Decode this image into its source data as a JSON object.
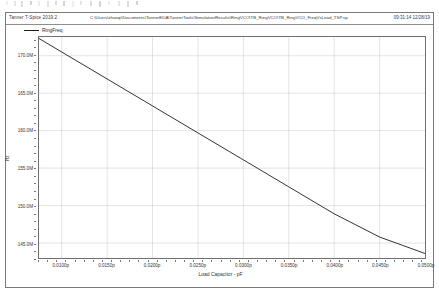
{
  "header": {
    "app_title": "Tanner T-Spice 2019.2",
    "file_path": "C:\\Users\\zhaoqi\\Documents\\TannerEDA\\TannerTools\\SimulationResults\\RingVCO\\TB_RingVCO\\TB_RingVCO_FreqVsLoad_TSP.sp",
    "timestamp": "09:31:14 12/28/19"
  },
  "legend": {
    "label": "RingFreq",
    "color": "#1b1b1b"
  },
  "chart_data": {
    "type": "line",
    "title": "",
    "xlabel": "Load Capacitor - pF",
    "ylabel": "Hz",
    "xlim": [
      0.0075,
      0.05
    ],
    "ylim": [
      143000000,
      172500000
    ],
    "grid": true,
    "legend_position": "top-left-outside",
    "xtick_labels": [
      "0.0100p",
      "0.0150p",
      "0.0200p",
      "0.0250p",
      "0.0300p",
      "0.0350p",
      "0.0400p",
      "0.0450p",
      "0.0500p"
    ],
    "xtick_values": [
      0.01,
      0.015,
      0.02,
      0.025,
      0.03,
      0.035,
      0.04,
      0.045,
      0.05
    ],
    "ytick_labels": [
      "170.0M",
      "165.0M",
      "160.0M",
      "155.0M",
      "150.0M",
      "145.0M"
    ],
    "ytick_values": [
      170000000,
      165000000,
      160000000,
      155000000,
      150000000,
      145000000
    ],
    "series": [
      {
        "name": "RingFreq",
        "color": "#1b1b1b",
        "x": [
          0.0075,
          0.01,
          0.015,
          0.02,
          0.025,
          0.03,
          0.035,
          0.04,
          0.045,
          0.05
        ],
        "y": [
          172300000,
          170500000,
          166900000,
          163300000,
          159700000,
          156100000,
          152500000,
          148900000,
          145800000,
          143600000
        ]
      }
    ]
  }
}
